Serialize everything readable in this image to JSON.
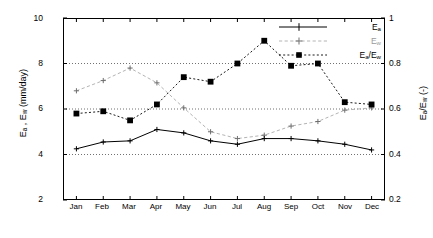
{
  "chart_data": {
    "type": "line",
    "title": "",
    "xlabel": "",
    "ylabel": "E_a , E_w  (mm/day)",
    "ylabel_right": "E_a/E_w  (-)",
    "categories": [
      "Jan",
      "Feb",
      "Mar",
      "Apr",
      "May",
      "Jun",
      "Jul",
      "Aug",
      "Sep",
      "Oct",
      "Nov",
      "Dec"
    ],
    "ylim": [
      2,
      10
    ],
    "ylim_right": [
      0.2,
      1.0
    ],
    "yticks": [
      2,
      4,
      6,
      8,
      10
    ],
    "yticks_right": [
      0.2,
      0.4,
      0.6,
      0.8,
      1.0
    ],
    "grid": true,
    "grid_style": "dotted horizontal at left-axis ticks",
    "legend_position": "top-right inside axes",
    "series": [
      {
        "name": "E_a",
        "axis": "left",
        "style": "solid line, small plus markers, black",
        "color": "#000000",
        "values": [
          4.25,
          4.55,
          4.6,
          5.1,
          4.95,
          4.6,
          4.45,
          4.7,
          4.7,
          4.6,
          4.45,
          4.2
        ]
      },
      {
        "name": "E_w",
        "axis": "left",
        "style": "dashed line, small plus markers, light gray",
        "color": "#b4b4b4",
        "values": [
          6.8,
          7.25,
          7.8,
          7.15,
          6.05,
          5.0,
          4.7,
          4.85,
          5.25,
          5.45,
          5.95,
          6.05
        ]
      },
      {
        "name": "E_a/E_w",
        "axis": "right",
        "style": "dashed line, filled square markers, black",
        "color": "#000000",
        "values": [
          0.58,
          0.59,
          0.55,
          0.62,
          0.74,
          0.72,
          0.8,
          0.9,
          0.79,
          0.8,
          0.63,
          0.62
        ]
      }
    ]
  },
  "axis": {
    "left_ticks": [
      "10",
      "8",
      "6",
      "4",
      "2"
    ],
    "right_ticks": [
      "1",
      "0.8",
      "0.6",
      "0.4",
      "0.2"
    ],
    "x_ticks": [
      "Jan",
      "Feb",
      "Mar",
      "Apr",
      "May",
      "Jun",
      "Jul",
      "Aug",
      "Sep",
      "Oct",
      "Nov",
      "Dec"
    ],
    "left_title_main": "E",
    "left_title_sub1": "a",
    "left_title_mid": " ,  E",
    "left_title_sub2": "w",
    "left_title_units": "   (mm/day)",
    "right_title_main": "E",
    "right_title_sub1": "a",
    "right_title_slash": "/E",
    "right_title_sub2": "w",
    "right_title_units": "   (-)"
  },
  "legend": {
    "entries": [
      {
        "label_main": "E",
        "label_sub": "a",
        "label_mid": "",
        "label_sub2": ""
      },
      {
        "label_main": "E",
        "label_sub": "w",
        "label_mid": "",
        "label_sub2": ""
      },
      {
        "label_main": "E",
        "label_sub": "a",
        "label_mid": "/E",
        "label_sub2": "w"
      }
    ]
  }
}
